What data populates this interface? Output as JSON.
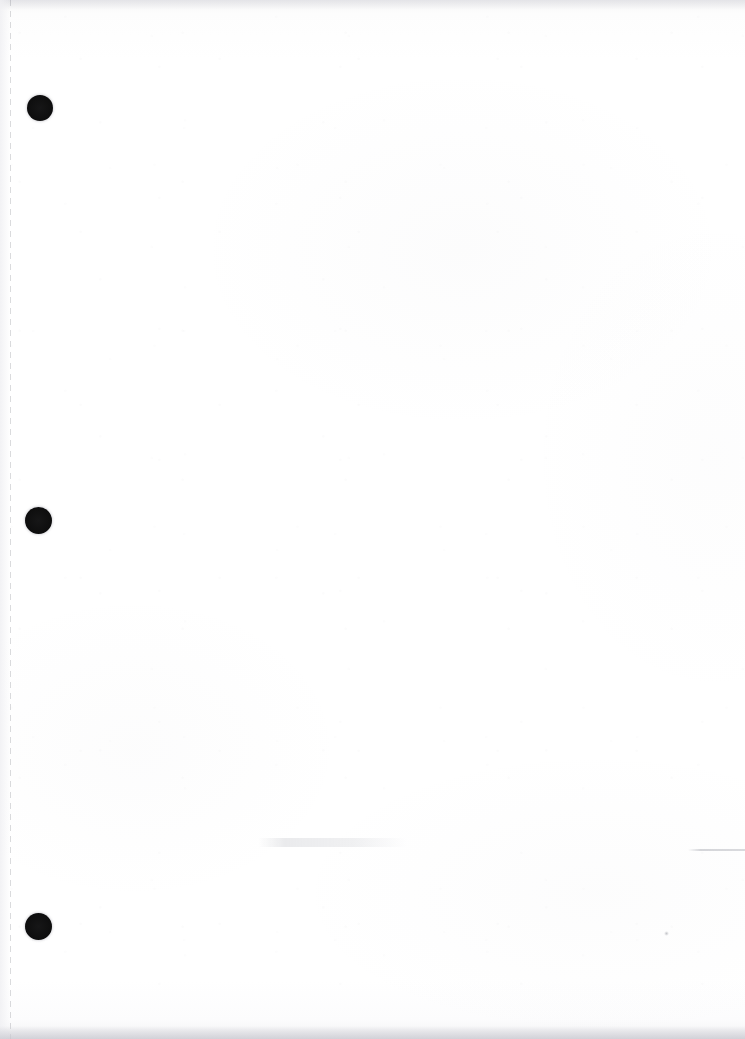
{
  "document": {
    "kind": "scanned-page",
    "title": "Blank scanned notebook page",
    "body_text": "",
    "page_width": 745,
    "page_height": 1039,
    "background_color": "#ffffff",
    "description": "A scanned blank sheet of white paper with a vertical dashed perforation line along the left margin and three black binder punch holes."
  },
  "perforation": {
    "name": "tear-off perforation",
    "orientation": "vertical",
    "x_position": 10,
    "dash_length": 6,
    "gap_length": 5,
    "color": "#787a82",
    "label": ""
  },
  "punch_holes": {
    "count": 3,
    "color": "#0b0b0b",
    "items": [
      {
        "id": "hole-1",
        "label": "",
        "x": 40,
        "y": 108,
        "diameter": 26
      },
      {
        "id": "hole-2",
        "label": "",
        "x": 38,
        "y": 520,
        "diameter": 27
      },
      {
        "id": "hole-3",
        "label": "",
        "x": 38,
        "y": 926,
        "diameter": 27
      }
    ]
  },
  "artifacts": {
    "smudge": {
      "name": "faint horizontal smudge",
      "x": 258,
      "y": 838,
      "width": 150,
      "color": "#babcc3"
    },
    "edge_rule": {
      "name": "faint rule near right edge",
      "x": 688,
      "y": 849,
      "width": 57,
      "color": "#a8aab2"
    },
    "speck": {
      "name": "ink speck",
      "x": 664,
      "y": 931,
      "diameter": 5,
      "color": "#969aa0"
    },
    "bottom_shadow": {
      "name": "scanner bottom edge shadow",
      "y": 1026,
      "color": "#c8c8d0"
    },
    "top_shadow": {
      "name": "scanner top edge shadow",
      "y": 0,
      "color": "#cdcdd4"
    }
  }
}
